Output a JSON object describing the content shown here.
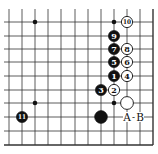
{
  "diagram": {
    "type": "go-board-fragment",
    "grid": {
      "columns_x": [
        9,
        22,
        35,
        48,
        61,
        75,
        88,
        101,
        114,
        127,
        140,
        153
      ],
      "rows_y": [
        22,
        36,
        49,
        62,
        76,
        90,
        103,
        117,
        131,
        145
      ],
      "extend_top_to": 9,
      "extend_left_to": 4,
      "right_edge": true,
      "bottom_edge": true,
      "line_color": "#333333"
    },
    "hoshi": [
      {
        "col": 2,
        "row": 0
      },
      {
        "col": 8,
        "row": 0
      },
      {
        "col": 2,
        "row": 6
      },
      {
        "col": 8,
        "row": 6
      }
    ],
    "stones": [
      {
        "color": "black",
        "col": 8,
        "row": 4,
        "label": "1"
      },
      {
        "color": "white",
        "col": 8,
        "row": 5,
        "label": "2"
      },
      {
        "color": "black",
        "col": 7,
        "row": 5,
        "label": "3"
      },
      {
        "color": "white",
        "col": 9,
        "row": 4,
        "label": "4"
      },
      {
        "color": "black",
        "col": 8,
        "row": 3,
        "label": "5"
      },
      {
        "color": "white",
        "col": 9,
        "row": 3,
        "label": "6"
      },
      {
        "color": "black",
        "col": 8,
        "row": 2,
        "label": "7"
      },
      {
        "color": "white",
        "col": 9,
        "row": 2,
        "label": "8"
      },
      {
        "color": "black",
        "col": 8,
        "row": 1,
        "label": "9"
      },
      {
        "color": "white",
        "col": 9,
        "row": 0,
        "label": "10"
      },
      {
        "color": "black",
        "col": 1,
        "row": 7,
        "label": "11"
      },
      {
        "color": "white",
        "col": 9,
        "row": 6,
        "label": ""
      },
      {
        "color": "black",
        "col": 7,
        "row": 7,
        "label": ""
      }
    ],
    "markers": [
      {
        "col": 9,
        "row": 7,
        "label": "A"
      },
      {
        "col": 10,
        "row": 7,
        "label": "B"
      }
    ],
    "marker_separator": "-"
  }
}
